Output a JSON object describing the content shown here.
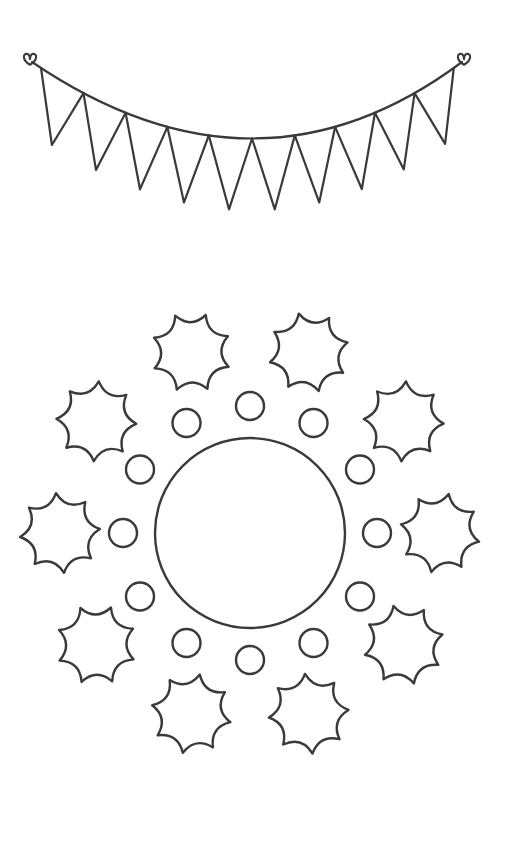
{
  "page": {
    "width": 514,
    "height": 856,
    "background_color": "#ffffff",
    "ink_color": "#3a3a3a",
    "style": "line-art coloring page, black outline on white, no text labels"
  },
  "artwork": {
    "name": "bunting-banner-and-sun-mandala",
    "elements_count": 2
  },
  "bunting": {
    "name": "bunting-banner",
    "description": "Curved string of triangular pennant flags with small heart-shaped tie knots at both ends",
    "stroke_width": 2.2,
    "flag_count": 10,
    "knot_count": 2,
    "string": {
      "left_anchor": {
        "x": 32,
        "y": 62
      },
      "sag_control": {
        "x": 257,
        "y": 215
      },
      "right_anchor": {
        "x": 462,
        "y": 62
      }
    },
    "knots": [
      {
        "name": "left-heart-knot",
        "x": 30,
        "y": 58,
        "size": 13
      },
      {
        "name": "right-heart-knot",
        "x": 464,
        "y": 58,
        "size": 13
      }
    ],
    "flags": [
      {
        "index": 1,
        "left_t": 0.02,
        "right_t": 0.115,
        "depth": 58
      },
      {
        "index": 2,
        "left_t": 0.115,
        "right_t": 0.21,
        "depth": 58
      },
      {
        "index": 3,
        "left_t": 0.21,
        "right_t": 0.305,
        "depth": 58
      },
      {
        "index": 4,
        "left_t": 0.305,
        "right_t": 0.4,
        "depth": 58
      },
      {
        "index": 5,
        "left_t": 0.4,
        "right_t": 0.5,
        "depth": 58
      },
      {
        "index": 6,
        "left_t": 0.5,
        "right_t": 0.6,
        "depth": 58
      },
      {
        "index": 7,
        "left_t": 0.6,
        "right_t": 0.695,
        "depth": 58
      },
      {
        "index": 8,
        "left_t": 0.695,
        "right_t": 0.79,
        "depth": 58
      },
      {
        "index": 9,
        "left_t": 0.79,
        "right_t": 0.885,
        "depth": 58
      },
      {
        "index": 10,
        "left_t": 0.885,
        "right_t": 0.98,
        "depth": 58
      }
    ]
  },
  "mandala": {
    "name": "sun-mandala",
    "description": "Concentric radial design: large empty center circle, ring of 12 small circles, outer ring of 10 eight-pointed burst shapes",
    "stroke_width": 2.4,
    "center": {
      "x": 250,
      "y": 533
    },
    "center_circle": {
      "name": "center-circle",
      "cx": 250,
      "cy": 533,
      "r": 95
    },
    "inner_ring": {
      "name": "small-circle-ring",
      "count": 12,
      "orbit_radius": 127,
      "circle_radius": 14,
      "start_angle_deg": -90,
      "angles_deg": [
        -90,
        -60,
        -30,
        0,
        30,
        60,
        90,
        120,
        150,
        180,
        210,
        240
      ]
    },
    "outer_ring": {
      "name": "burst-star-ring",
      "count": 10,
      "orbit_radius": 190,
      "star_radius": 40,
      "star_inner_ratio": 0.74,
      "points_per_star": 8,
      "start_angle_deg": -108,
      "angles_deg": [
        -108,
        -72,
        -36,
        0,
        36,
        72,
        108,
        144,
        180,
        216
      ]
    }
  }
}
